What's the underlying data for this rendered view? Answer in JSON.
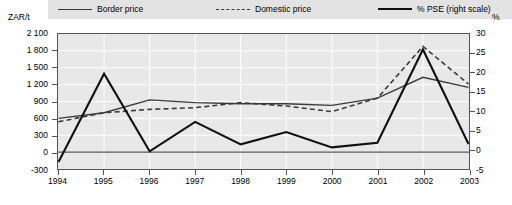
{
  "legend": {
    "items": [
      {
        "label": "Border price",
        "style": "solid-thin",
        "color": "#3a3a3a"
      },
      {
        "label": "Domestic price",
        "style": "dashed",
        "color": "#3a3a3a"
      },
      {
        "label": "% PSE (right scale)",
        "style": "solid-thick",
        "color": "#111111"
      }
    ]
  },
  "axes": {
    "left_unit": "ZAR/t",
    "right_unit": "%"
  },
  "chart_data": {
    "type": "line",
    "title": "",
    "xlabel": "",
    "ylabel": "ZAR/t",
    "y2label": "%",
    "grid": true,
    "legend_position": "top",
    "categories": [
      "1994",
      "1995",
      "1996",
      "1997",
      "1998",
      "1999",
      "2000",
      "2001",
      "2002",
      "2003"
    ],
    "xticklabels": [
      "1994",
      "1995",
      "1996",
      "1997",
      "1998",
      "1999",
      "2000",
      "2001",
      "2002",
      "2003"
    ],
    "ylim": [
      -300,
      2100
    ],
    "yticks": [
      -300,
      0,
      300,
      600,
      900,
      1200,
      1500,
      1800,
      2100
    ],
    "yticklabels": [
      "-300",
      "0",
      "300",
      "600",
      "900",
      "1 200",
      "1 500",
      "1 800",
      "2 100"
    ],
    "y2lim": [
      -5,
      30
    ],
    "y2ticks": [
      -5,
      0,
      5,
      10,
      15,
      20,
      25,
      30
    ],
    "y2ticklabels": [
      "-5",
      "0",
      "5",
      "10",
      "15",
      "20",
      "25",
      "30"
    ],
    "series": [
      {
        "name": "Border price",
        "axis": "left",
        "style": "solid",
        "values": [
          600,
          700,
          930,
          880,
          860,
          860,
          830,
          960,
          1330,
          1150
        ]
      },
      {
        "name": "Domestic price",
        "axis": "left",
        "style": "dashed",
        "values": [
          540,
          700,
          760,
          790,
          880,
          820,
          720,
          960,
          1880,
          1210
        ]
      },
      {
        "name": "% PSE (right scale)",
        "axis": "right",
        "style": "solid-thick",
        "values": [
          -3.2,
          19.7,
          -0.4,
          7.2,
          1.4,
          4.6,
          0.6,
          1.8,
          26.0,
          1.5
        ]
      }
    ]
  }
}
